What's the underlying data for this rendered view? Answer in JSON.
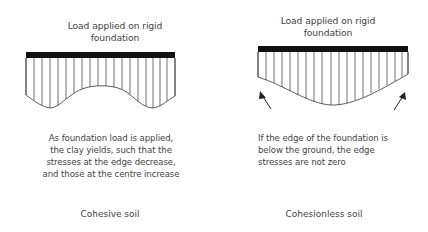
{
  "diagram": {
    "panels": [
      {
        "title_line1": "Load applied on rigid",
        "title_line2": "foundation",
        "description": [
          "As foundation load is applied,",
          "the clay yields, such that the",
          "stresses at the edge decrease,",
          "and those at the centre increase"
        ],
        "caption": "Cohesive soil",
        "distribution": "edge stresses reduced, saddle-shaped with centre raised"
      },
      {
        "title_line1": "Load applied on rigid",
        "title_line2": "foundation",
        "description": [
          "If the edge of the foundation is",
          "below the ground, the edge",
          "stresses are not zero"
        ],
        "caption": "Cohesionless soil",
        "distribution": "parabolic, maximum at centre, non-zero at edges (arrows)"
      }
    ],
    "colors": {
      "foundation": "#111111",
      "lines": "#333333",
      "text": "#444444",
      "background": "#ffffff"
    }
  }
}
